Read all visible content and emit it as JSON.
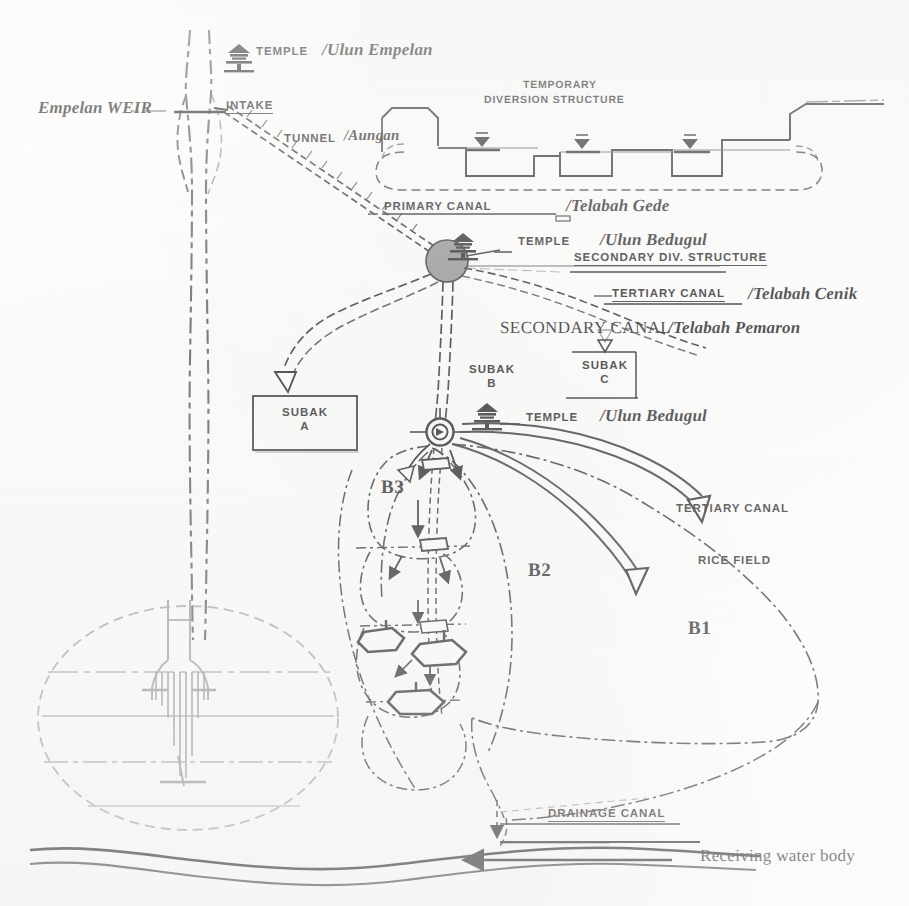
{
  "figure": {
    "ink_color": "#1b1b1b",
    "node_fill": "#8d8d8d",
    "paper_color": "#fefefd"
  },
  "labels": {
    "temple_upper": "TEMPLE",
    "temple_upper_local": "/Ulun Empelan",
    "weir": "Empelan WEIR",
    "intake": "INTAKE",
    "tunnel": "TUNNEL",
    "tunnel_local": "/Aungan",
    "temporary_diversion_line1": "TEMPORARY",
    "temporary_diversion_line2": "DIVERSION STRUCTURE",
    "primary_canal": "PRIMARY CANAL",
    "primary_canal_local": "/Telabah Gede",
    "temple_mid": "TEMPLE",
    "temple_mid_local": "/Ulun Bedugul",
    "secondary_div_structure": "SECONDARY DIV. STRUCTURE",
    "tertiary_canal_upper": "TERTIARY CANAL",
    "tertiary_canal_upper_local": "/Telabah Cenik",
    "secondary_canal": "SECONDARY CANAL",
    "secondary_canal_local": "/Telabah Pemaron",
    "subak_b_line1": "SUBAK",
    "subak_b_line2": "B",
    "subak_c_line1": "SUBAK",
    "subak_c_line2": "C",
    "subak_a_line1": "SUBAK",
    "subak_a_line2": "A",
    "temple_lower": "TEMPLE",
    "temple_lower_local": "/Ulun Bedugul",
    "tertiary_canal_right": "TERTIARY CANAL",
    "rice_field": "RICE FIELD",
    "block_b1": "B1",
    "block_b2": "B2",
    "block_b3": "B3",
    "drainage_canal": "DRAINAGE CANAL",
    "receiving_water_body": "Receiving  water body"
  },
  "icons": {
    "temple_upper": "temple-icon",
    "temple_mid": "temple-icon",
    "temple_lower": "temple-icon",
    "secondary_structure_node": "filled-circle-node",
    "tertiary_structure_node": "ring-node",
    "gate_symbols": [
      "gate-icon",
      "gate-icon",
      "gate-icon"
    ],
    "inset": "weir-detail-inset"
  }
}
